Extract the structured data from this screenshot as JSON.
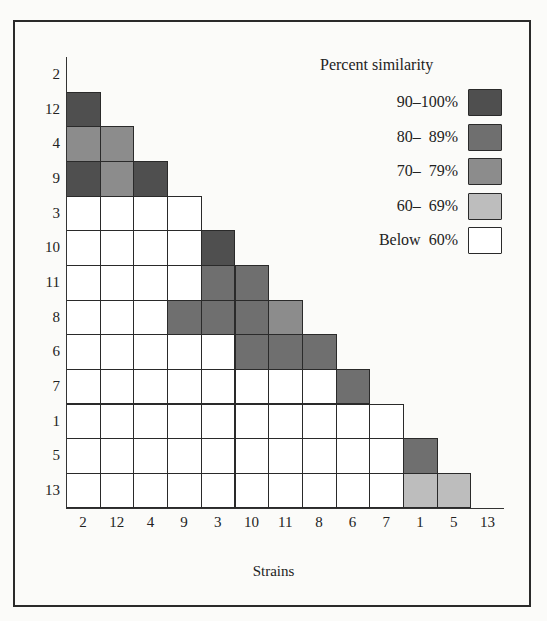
{
  "chart_data": {
    "type": "heatmap",
    "title": "",
    "xlabel": "Strains",
    "ylabel": "",
    "legend_title": "Percent similarity",
    "legend_position": "upper-right",
    "grid": true,
    "strains": [
      "2",
      "12",
      "4",
      "9",
      "3",
      "10",
      "11",
      "8",
      "6",
      "7",
      "1",
      "5",
      "13"
    ],
    "categories": [
      {
        "key": "90-100",
        "label": "90–100%",
        "color": "#4f4f4f"
      },
      {
        "key": "80-89",
        "label": "80–  89%",
        "color": "#6f6f6f"
      },
      {
        "key": "70-79",
        "label": "70–  79%",
        "color": "#8c8c8c"
      },
      {
        "key": "60-69",
        "label": "60–  69%",
        "color": "#bdbdbd"
      },
      {
        "key": "below-60",
        "label": "Below  60%",
        "color": "#ffffff"
      }
    ],
    "matrix_lower_triangle": [
      {
        "row": "2",
        "cells": []
      },
      {
        "row": "12",
        "cells": [
          "90-100"
        ]
      },
      {
        "row": "4",
        "cells": [
          "70-79",
          "70-79"
        ]
      },
      {
        "row": "9",
        "cells": [
          "90-100",
          "70-79",
          "90-100"
        ]
      },
      {
        "row": "3",
        "cells": [
          "below-60",
          "below-60",
          "below-60",
          "below-60"
        ]
      },
      {
        "row": "10",
        "cells": [
          "below-60",
          "below-60",
          "below-60",
          "below-60",
          "90-100"
        ]
      },
      {
        "row": "11",
        "cells": [
          "below-60",
          "below-60",
          "below-60",
          "below-60",
          "80-89",
          "80-89"
        ]
      },
      {
        "row": "8",
        "cells": [
          "below-60",
          "below-60",
          "below-60",
          "80-89",
          "80-89",
          "80-89",
          "70-79"
        ]
      },
      {
        "row": "6",
        "cells": [
          "below-60",
          "below-60",
          "below-60",
          "below-60",
          "below-60",
          "80-89",
          "80-89",
          "80-89"
        ]
      },
      {
        "row": "7",
        "cells": [
          "below-60",
          "below-60",
          "below-60",
          "below-60",
          "below-60",
          "below-60",
          "below-60",
          "below-60",
          "80-89"
        ]
      },
      {
        "row": "1",
        "cells": [
          "below-60",
          "below-60",
          "below-60",
          "below-60",
          "below-60",
          "below-60",
          "below-60",
          "below-60",
          "below-60",
          "below-60"
        ]
      },
      {
        "row": "5",
        "cells": [
          "below-60",
          "below-60",
          "below-60",
          "below-60",
          "below-60",
          "below-60",
          "below-60",
          "below-60",
          "below-60",
          "below-60",
          "80-89"
        ]
      },
      {
        "row": "13",
        "cells": [
          "below-60",
          "below-60",
          "below-60",
          "below-60",
          "below-60",
          "below-60",
          "below-60",
          "below-60",
          "below-60",
          "below-60",
          "60-69",
          "60-69"
        ]
      }
    ]
  }
}
